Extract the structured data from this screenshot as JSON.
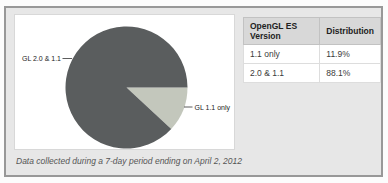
{
  "chart_data": {
    "type": "pie",
    "title": "",
    "categories": [
      "1.1 only",
      "2.0 & 1.1"
    ],
    "values": [
      11.9,
      88.1
    ],
    "point_labels": [
      "GL 1.1 only",
      "GL 2.0 & 1.1"
    ],
    "colors": [
      "#c3c7bc",
      "#5a5d5e"
    ],
    "start_angle_deg": 0,
    "direction": "clockwise",
    "legend_position": "none"
  },
  "table": {
    "headers": [
      "OpenGL ES Version",
      "Distribution"
    ],
    "rows": [
      [
        "1.1 only",
        "11.9%"
      ],
      [
        "2.0 & 1.1",
        "88.1%"
      ]
    ]
  },
  "caption": "Data collected during a 7-day period ending on April 2, 2012",
  "colors": {
    "panel_background": "#e7e7e7",
    "panel_border": "#989898",
    "table_header_background": "#d8d8d8",
    "chart_box_background": "#ffffff"
  }
}
